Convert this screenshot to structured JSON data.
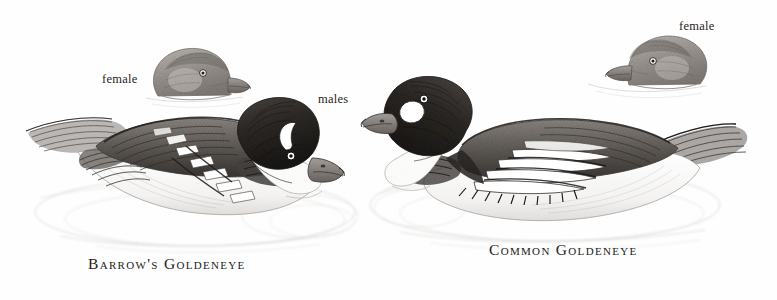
{
  "plate": {
    "kind": "field-guide-pencil-illustration",
    "medium": "graphite pencil drawing",
    "background_color": "#fefefe",
    "ink_color": "#221d1b",
    "width": 777,
    "height": 300
  },
  "captions": {
    "barrows": "Barrow's Goldeneye",
    "common": "Common Goldeneye"
  },
  "labels": {
    "female_left": "female",
    "males": "males",
    "female_right": "female"
  },
  "subjects": [
    {
      "id": "barrows-male",
      "species": "Barrow's Goldeneye",
      "sex": "male",
      "view": "swimming profile, facing right",
      "face_patch": "white crescent",
      "scapulars": "row of separate white squares",
      "position": {
        "x": 10,
        "y": 100,
        "w": 345,
        "h": 140
      }
    },
    {
      "id": "barrows-female-head",
      "species": "Barrow's Goldeneye",
      "sex": "female",
      "view": "head study, facing right",
      "position": {
        "x": 145,
        "y": 48,
        "w": 110,
        "h": 60
      }
    },
    {
      "id": "common-male",
      "species": "Common Goldeneye",
      "sex": "male",
      "view": "swimming profile, facing left",
      "face_patch": "round white spot",
      "scapulars": "long white stripes",
      "position": {
        "x": 370,
        "y": 75,
        "w": 370,
        "h": 155
      }
    },
    {
      "id": "common-female-head",
      "species": "Common Goldeneye",
      "sex": "female",
      "view": "head study, facing left",
      "position": {
        "x": 592,
        "y": 28,
        "w": 115,
        "h": 70
      }
    }
  ],
  "palette": {
    "paper": "#fefefe",
    "graphite_dark": "#2b2724",
    "graphite_mid": "#6f6a66",
    "graphite_light": "#b6b1ad",
    "graphite_faint": "#dcd9d6",
    "text": "#221d1b"
  }
}
